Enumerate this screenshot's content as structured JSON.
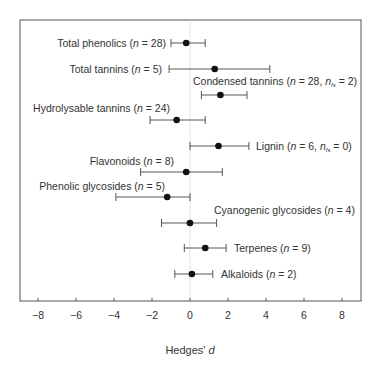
{
  "chart_data": {
    "type": "forest",
    "title": "",
    "xlabel": "Hedges' d",
    "ylabel": "",
    "xlim": [
      -9,
      9
    ],
    "xticks": [
      -8,
      -6,
      -4,
      -2,
      0,
      2,
      4,
      6,
      8
    ],
    "xtick_labels": [
      "−8",
      "−6",
      "−4",
      "−2",
      "0",
      "2",
      "4",
      "6",
      "8"
    ],
    "reference_line": 0,
    "grid": false,
    "rows": [
      {
        "name": "Total phenolics",
        "n": 28,
        "label": "Total phenolics (n = 28)",
        "label_side": "left",
        "estimate": -0.2,
        "ci_low": -1.0,
        "ci_high": 0.8
      },
      {
        "name": "Total tannins",
        "n": 5,
        "label": "Total tannins (n = 5)",
        "label_side": "left",
        "estimate": 1.3,
        "ci_low": -1.1,
        "ci_high": 4.2
      },
      {
        "name": "Condensed tannins",
        "n": 28,
        "n_fs": 2,
        "label": "Condensed tannins (n = 28, n_fs = 2)",
        "label_side": "above-right",
        "estimate": 1.6,
        "ci_low": 0.6,
        "ci_high": 3.0
      },
      {
        "name": "Hydrolysable tannins",
        "n": 24,
        "label": "Hydrolysable tannins (n = 24)",
        "label_side": "above-left",
        "estimate": -0.7,
        "ci_low": -2.1,
        "ci_high": 0.8
      },
      {
        "name": "Lignin",
        "n": 6,
        "n_fs": 0,
        "label": "Lignin (n = 6, n_fs = 0)",
        "label_side": "right",
        "estimate": 1.5,
        "ci_low": 0.0,
        "ci_high": 3.1
      },
      {
        "name": "Flavonoids",
        "n": 8,
        "label": "Flavonoids (n = 8)",
        "label_side": "above-left",
        "estimate": -0.2,
        "ci_low": -2.6,
        "ci_high": 1.7
      },
      {
        "name": "Phenolic glycosides",
        "n": 5,
        "label": "Phenolic glycosides (n = 5)",
        "label_side": "above-left",
        "estimate": -1.2,
        "ci_low": -3.9,
        "ci_high": 0.0
      },
      {
        "name": "Cyanogenic glycosides",
        "n": 4,
        "label": "Cyanogenic glycosides (n = 4)",
        "label_side": "above-right",
        "estimate": 0.0,
        "ci_low": -1.5,
        "ci_high": 1.4
      },
      {
        "name": "Terpenes",
        "n": 9,
        "label": "Terpenes (n = 9)",
        "label_side": "right",
        "estimate": 0.8,
        "ci_low": -0.3,
        "ci_high": 1.9
      },
      {
        "name": "Alkaloids",
        "n": 2,
        "label": "Alkaloids (n = 2)",
        "label_side": "right",
        "estimate": 0.1,
        "ci_low": -0.8,
        "ci_high": 1.2
      }
    ]
  },
  "layout": {
    "plot": {
      "left": 20,
      "right": 361,
      "top": 20,
      "bottom": 301
    },
    "x0_px": 190,
    "px_per_unit": 19,
    "row_y": [
      43,
      69,
      95,
      120,
      146,
      172,
      197,
      223,
      248,
      274
    ],
    "labels": [
      {
        "x": 166,
        "y": 47,
        "anchor": "end"
      },
      {
        "x": 162,
        "y": 73,
        "anchor": "end"
      },
      {
        "x": 193,
        "y": 85,
        "anchor": "start"
      },
      {
        "x": 170,
        "y": 112,
        "anchor": "end"
      },
      {
        "x": 256,
        "y": 150,
        "anchor": "start"
      },
      {
        "x": 174,
        "y": 165,
        "anchor": "end"
      },
      {
        "x": 165,
        "y": 190,
        "anchor": "end"
      },
      {
        "x": 214,
        "y": 214,
        "anchor": "start"
      },
      {
        "x": 234,
        "y": 252,
        "anchor": "start"
      },
      {
        "x": 221,
        "y": 278,
        "anchor": "start"
      }
    ]
  }
}
